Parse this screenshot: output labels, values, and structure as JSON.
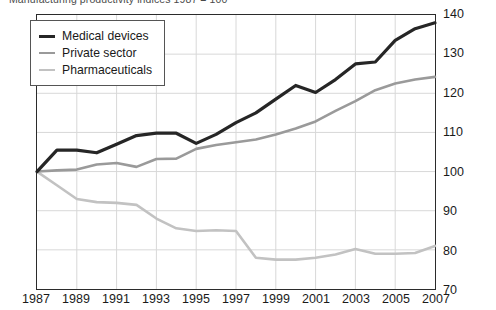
{
  "chart_data": {
    "type": "line",
    "title": "Manufacturing productivity indices 1987 = 100",
    "xlabel": "",
    "ylabel": "",
    "xlim": [
      1987,
      2007
    ],
    "ylim": [
      70,
      140
    ],
    "y_axis_position": "right",
    "grid": true,
    "legend_position": "top-left",
    "x": [
      1987,
      1988,
      1989,
      1990,
      1991,
      1992,
      1993,
      1994,
      1995,
      1996,
      1997,
      1998,
      1999,
      2000,
      2001,
      2002,
      2003,
      2004,
      2005,
      2006,
      2007
    ],
    "x_tick_labels": [
      "1987",
      "1989",
      "1991",
      "1993",
      "1995",
      "1997",
      "1999",
      "2001",
      "2003",
      "2005",
      "2007"
    ],
    "x_ticks": [
      1987,
      1989,
      1991,
      1993,
      1995,
      1997,
      1999,
      2001,
      2003,
      2005,
      2007
    ],
    "y_ticks": [
      70,
      80,
      90,
      100,
      110,
      120,
      130,
      140
    ],
    "y_tick_labels": [
      "70",
      "80",
      "90",
      "100",
      "110",
      "120",
      "130",
      "140"
    ],
    "series": [
      {
        "name": "Medical devices",
        "color": "#262626",
        "width": 3.2,
        "values": [
          100.0,
          105.5,
          105.5,
          104.8,
          107.0,
          109.2,
          109.8,
          109.8,
          107.2,
          109.5,
          112.5,
          115.0,
          118.5,
          122.0,
          120.2,
          123.5,
          127.5,
          128.0,
          133.5,
          136.5,
          138.0
        ]
      },
      {
        "name": "Private sector",
        "color": "#9a9a9a",
        "width": 2.6,
        "values": [
          100.0,
          100.3,
          100.5,
          101.8,
          102.2,
          101.2,
          103.2,
          103.3,
          105.8,
          106.8,
          107.5,
          108.2,
          109.5,
          111.0,
          112.8,
          115.5,
          118.0,
          120.8,
          122.5,
          123.5,
          124.2
        ]
      },
      {
        "name": "Pharmaceuticals",
        "color": "#c2c2c2",
        "width": 2.6,
        "values": [
          100.0,
          96.5,
          93.0,
          92.2,
          92.0,
          91.5,
          88.0,
          85.5,
          84.8,
          85.0,
          84.8,
          78.0,
          77.5,
          77.5,
          78.0,
          78.8,
          80.2,
          79.0,
          79.0,
          79.2,
          81.0
        ]
      }
    ]
  },
  "legend": {
    "items": [
      {
        "label": "Medical devices"
      },
      {
        "label": "Private sector"
      },
      {
        "label": "Pharmaceuticals"
      }
    ]
  }
}
